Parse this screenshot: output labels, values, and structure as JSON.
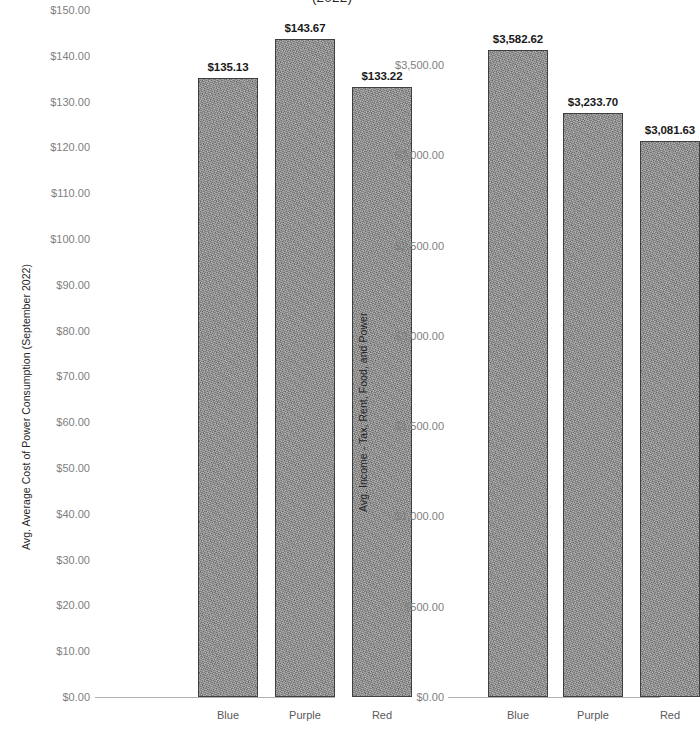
{
  "title": "(2022)",
  "chart_data": [
    {
      "type": "bar",
      "panel": "left",
      "title": "",
      "xlabel": "",
      "ylabel": "Avg. Average Cost of Power Consumption (September 2022)",
      "categories": [
        "Blue",
        "Purple",
        "Red"
      ],
      "values": [
        135.13,
        143.67,
        133.22
      ],
      "data_labels": [
        "$135.13",
        "$143.67",
        "$133.22"
      ],
      "ylim": [
        0,
        150
      ],
      "ytick_values": [
        150,
        140,
        130,
        120,
        110,
        100,
        90,
        80,
        70,
        60,
        50,
        40,
        30,
        20,
        10,
        0
      ],
      "ytick_labels": [
        "$150.00",
        "$140.00",
        "$130.00",
        "$120.00",
        "$110.00",
        "$100.00",
        "$90.00",
        "$80.00",
        "$70.00",
        "$60.00",
        "$50.00",
        "$40.00",
        "$30.00",
        "$20.00",
        "$10.00",
        "$0.00"
      ],
      "grid": false,
      "legend": "none",
      "bar_color": "#8b8b8b",
      "bar_border_color": "#3f3f3f"
    },
    {
      "type": "bar",
      "panel": "right",
      "title": "",
      "xlabel": "",
      "ylabel": "Avg. Income - Tax, Rent, Food, and Power",
      "categories": [
        "Blue",
        "Purple",
        "Red"
      ],
      "values": [
        3582.62,
        3233.7,
        3081.63
      ],
      "data_labels": [
        "$3,582.62",
        "$3,233.70",
        "$3,081.63"
      ],
      "ylim": [
        0,
        3750
      ],
      "ytick_values": [
        3500,
        3000,
        2500,
        2000,
        1500,
        1000,
        500,
        0
      ],
      "ytick_labels": [
        "$3,500.00",
        "$3,000.00",
        "$2,500.00",
        "$2,000.00",
        "$1,500.00",
        "$1,000.00",
        "$500.00",
        "$0.00"
      ],
      "grid": false,
      "legend": "none",
      "bar_color": "#8b8b8b",
      "bar_border_color": "#3f3f3f"
    }
  ]
}
